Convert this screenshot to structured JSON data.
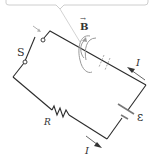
{
  "diagram": {
    "type": "circuit",
    "callout": {
      "visible": true,
      "text": ""
    },
    "labels": {
      "switch": "S",
      "magnetic_field": "B",
      "magnetic_field_vector_arrow": "→",
      "resistor": "R",
      "emf": "ε",
      "current_top": "I",
      "current_bottom": "I"
    },
    "colors": {
      "wire": "#2b2b2b",
      "field_lines": "#9a9a9a",
      "callout_border": "#c8c8c8",
      "text": "#333333",
      "current_arrow": "#444444"
    },
    "components": [
      {
        "id": "switch",
        "label": "S",
        "state": "open"
      },
      {
        "id": "resistor",
        "label": "R"
      },
      {
        "id": "battery",
        "label": "ε"
      },
      {
        "id": "field-loops",
        "label": "B"
      }
    ]
  }
}
